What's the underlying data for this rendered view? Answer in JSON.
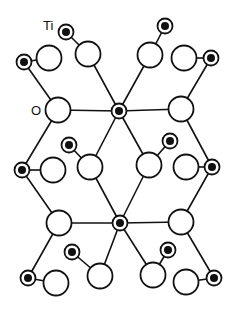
{
  "figure": {
    "type": "crystal-structure",
    "labels": {
      "ti": "Ti",
      "o": "O"
    },
    "colors": {
      "stroke": "#111111",
      "fill": "#ffffff",
      "ti_core": "#111111"
    },
    "ti_atoms": [
      [
        66,
        32
      ],
      [
        24,
        62
      ],
      [
        165,
        26
      ],
      [
        211,
        58
      ],
      [
        119,
        111
      ],
      [
        69,
        145
      ],
      [
        170,
        141
      ],
      [
        22,
        170
      ],
      [
        212,
        167
      ],
      [
        120,
        223
      ],
      [
        72,
        252
      ],
      [
        168,
        250
      ],
      [
        28,
        278
      ],
      [
        214,
        278
      ]
    ],
    "o_atoms": [
      [
        88,
        54
      ],
      [
        49,
        58
      ],
      [
        150,
        55
      ],
      [
        184,
        58
      ],
      [
        58,
        110
      ],
      [
        181,
        109
      ],
      [
        53,
        170
      ],
      [
        90,
        167
      ],
      [
        149,
        165
      ],
      [
        186,
        167
      ],
      [
        59,
        223
      ],
      [
        181,
        222
      ],
      [
        100,
        276
      ],
      [
        56,
        283
      ],
      [
        153,
        275
      ],
      [
        186,
        282
      ]
    ],
    "bonds": [
      [
        66,
        32,
        88,
        54
      ],
      [
        24,
        62,
        49,
        58
      ],
      [
        165,
        26,
        150,
        55
      ],
      [
        184,
        58,
        211,
        58
      ],
      [
        88,
        54,
        119,
        111
      ],
      [
        150,
        55,
        119,
        111
      ],
      [
        24,
        62,
        58,
        110
      ],
      [
        211,
        58,
        181,
        109
      ],
      [
        58,
        110,
        119,
        111
      ],
      [
        119,
        111,
        181,
        109
      ],
      [
        119,
        111,
        90,
        167
      ],
      [
        119,
        111,
        149,
        165
      ],
      [
        69,
        145,
        90,
        167
      ],
      [
        170,
        141,
        149,
        165
      ],
      [
        58,
        110,
        22,
        170
      ],
      [
        181,
        109,
        212,
        167
      ],
      [
        22,
        170,
        53,
        170
      ],
      [
        186,
        167,
        212,
        167
      ],
      [
        90,
        167,
        120,
        223
      ],
      [
        149,
        165,
        120,
        223
      ],
      [
        22,
        170,
        59,
        223
      ],
      [
        212,
        167,
        181,
        222
      ],
      [
        59,
        223,
        120,
        223
      ],
      [
        120,
        223,
        181,
        222
      ],
      [
        120,
        223,
        100,
        276
      ],
      [
        120,
        223,
        153,
        275
      ],
      [
        72,
        252,
        100,
        276
      ],
      [
        168,
        250,
        153,
        275
      ],
      [
        59,
        223,
        28,
        278
      ],
      [
        181,
        222,
        214,
        278
      ],
      [
        28,
        278,
        56,
        283
      ],
      [
        186,
        282,
        214,
        278
      ]
    ]
  }
}
